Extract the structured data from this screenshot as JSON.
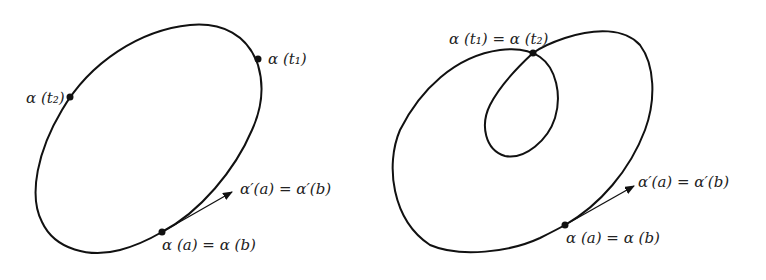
{
  "figures": [
    {
      "id": "simple-closed-curve",
      "labels": {
        "t1": "α (t₁)",
        "t2": "α (t₂)",
        "tangent": "α′(a) = α′(b)",
        "start": "α (a) = α (b)"
      }
    },
    {
      "id": "self-intersecting-closed-curve",
      "labels": {
        "intersection": "α (t₁) = α (t₂)",
        "tangent": "α′(a) = α′(b)",
        "start": "α (a) = α (b)"
      }
    }
  ],
  "colors": {
    "stroke": "#111111",
    "text": "#222222",
    "background": "#ffffff"
  }
}
